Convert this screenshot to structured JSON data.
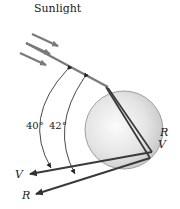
{
  "title": "Sunlight",
  "angles": {
    "inner": "40°",
    "outer": "42°"
  },
  "labels": {
    "red_exit": "R",
    "violet_exit": "V",
    "red_back": "R",
    "violet_back": "V"
  },
  "colors": {
    "ray": "#7a7a7a",
    "ray_dark": "#3a3a3a",
    "sphere_edge": "#8a8a8a",
    "sphere_center": "#fafafa",
    "sphere_rim": "#c8c8c8",
    "arc": "#333333"
  }
}
